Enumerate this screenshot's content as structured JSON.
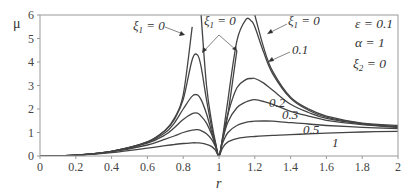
{
  "chart_data": {
    "type": "line",
    "title": "",
    "xlabel": "r",
    "ylabel": "μ",
    "xlim": [
      0,
      2
    ],
    "ylim": [
      0,
      6
    ],
    "grid": false,
    "x_ticks": [
      "0",
      "0.2",
      "0.4",
      "0.6",
      "0.8",
      "1",
      "1.2",
      "1.4",
      "1.6",
      "1.8",
      "2"
    ],
    "y_ticks": [
      "0",
      "1",
      "2",
      "3",
      "4",
      "5",
      "6"
    ],
    "parameters": [
      {
        "name": "ε",
        "value": "0.1"
      },
      {
        "name": "α",
        "value": "1"
      },
      {
        "name": "ξ2",
        "value": "0"
      }
    ],
    "x": [
      0,
      0.2,
      0.4,
      0.6,
      0.7,
      0.75,
      0.8,
      0.85,
      0.88,
      0.9,
      0.93,
      0.96,
      0.98,
      1.0,
      1.02,
      1.05,
      1.1,
      1.15,
      1.18,
      1.2,
      1.25,
      1.3,
      1.4,
      1.5,
      1.6,
      1.8,
      2.0
    ],
    "series": [
      {
        "name": "ξ1 = 0 (left branch)",
        "values": [
          0,
          0.04,
          0.2,
          0.6,
          1.1,
          1.6,
          2.6,
          5.5,
          null,
          null,
          null,
          null,
          null,
          null,
          null,
          null,
          null,
          null,
          null,
          null,
          null,
          null,
          null,
          null,
          null,
          null,
          null
        ]
      },
      {
        "name": "ξ1 = 0 (middle branch)",
        "values": [
          null,
          null,
          null,
          null,
          null,
          null,
          null,
          null,
          null,
          6.0,
          3.0,
          1.4,
          0.6,
          0,
          0.7,
          1.8,
          4.5,
          null,
          null,
          null,
          null,
          null,
          null,
          null,
          null,
          null,
          null
        ]
      },
      {
        "name": "ξ1 = 0 (right branch)",
        "values": [
          null,
          null,
          null,
          null,
          null,
          null,
          null,
          null,
          null,
          null,
          null,
          null,
          null,
          null,
          null,
          null,
          null,
          null,
          null,
          6.0,
          4.6,
          3.6,
          2.5,
          2.0,
          1.7,
          1.4,
          1.3
        ]
      },
      {
        "name": "0.1",
        "values": [
          0,
          0.04,
          0.2,
          0.6,
          1.1,
          1.55,
          2.4,
          4.1,
          4.3,
          3.8,
          2.4,
          1.2,
          0.55,
          0,
          0.8,
          2.4,
          4.9,
          5.8,
          5.75,
          5.5,
          4.4,
          3.5,
          2.45,
          1.95,
          1.65,
          1.38,
          1.25
        ]
      },
      {
        "name": "0.2",
        "values": [
          0,
          0.04,
          0.2,
          0.58,
          1.0,
          1.4,
          2.0,
          2.55,
          2.6,
          2.4,
          1.8,
          1.0,
          0.5,
          0,
          0.75,
          1.8,
          2.9,
          3.25,
          3.3,
          3.3,
          3.1,
          2.8,
          2.2,
          1.85,
          1.6,
          1.36,
          1.24
        ]
      },
      {
        "name": "0.3",
        "values": [
          0,
          0.04,
          0.19,
          0.55,
          0.9,
          1.2,
          1.55,
          1.8,
          1.82,
          1.7,
          1.4,
          0.9,
          0.45,
          0,
          0.7,
          1.45,
          2.05,
          2.3,
          2.38,
          2.4,
          2.32,
          2.2,
          1.9,
          1.7,
          1.52,
          1.33,
          1.22
        ]
      },
      {
        "name": "0.5",
        "values": [
          0,
          0.04,
          0.18,
          0.47,
          0.72,
          0.85,
          1.0,
          1.1,
          1.12,
          1.08,
          0.95,
          0.7,
          0.4,
          0,
          0.55,
          1.0,
          1.3,
          1.43,
          1.47,
          1.48,
          1.49,
          1.48,
          1.42,
          1.36,
          1.3,
          1.22,
          1.17
        ]
      },
      {
        "name": "1",
        "values": [
          0,
          0.03,
          0.14,
          0.33,
          0.44,
          0.49,
          0.53,
          0.56,
          0.56,
          0.55,
          0.5,
          0.4,
          0.25,
          0,
          0.35,
          0.6,
          0.74,
          0.8,
          0.82,
          0.83,
          0.86,
          0.88,
          0.91,
          0.94,
          0.97,
          1.02,
          1.05
        ]
      }
    ]
  },
  "labels": {
    "y_axis": "μ",
    "x_axis": "r",
    "annot_xi1_left": "ξ1 = 0",
    "annot_xi1_mid": "ξ1 = 0",
    "annot_xi1_right": "ξ1 = 0",
    "annot_01": "0.1",
    "annot_02": "0.2",
    "annot_03": "0.3",
    "annot_05": "0.5",
    "annot_1": "1",
    "param_eps": "ε = 0.1",
    "param_alpha": "α = 1",
    "param_xi2": "ξ2 = 0"
  }
}
